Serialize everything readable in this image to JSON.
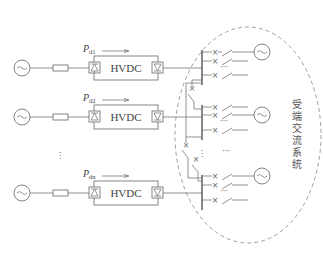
{
  "diagram": {
    "type": "multi-infeed HVDC power system schematic",
    "links": [
      {
        "id": "link-1",
        "power_label": "P",
        "power_subscript": "d1",
        "converter_label": "HVDC"
      },
      {
        "id": "link-2",
        "power_label": "P",
        "power_subscript": "d2",
        "converter_label": "HVDC"
      },
      {
        "id": "link-n",
        "power_label": "P",
        "power_subscript": "dn",
        "converter_label": "HVDC"
      }
    ],
    "sending_ellipsis": "⋮",
    "receiving_system": {
      "label": "受端交流系统",
      "label_chars": [
        "受",
        "端",
        "交",
        "流",
        "系",
        "统"
      ]
    },
    "feeder_ellipsis": "···",
    "icons": {
      "generator": "ac-generator-icon (circle with ~)",
      "impedance": "impedance-icon (rectangle)",
      "rectifier": "rectifier-icon (boxed diode)",
      "inverter": "inverter-icon (boxed diode)",
      "breaker": "circuit-breaker-icon (x)",
      "switch": "disconnect-switch-icon",
      "arrow": "power-flow-arrow-icon"
    },
    "colors": {
      "line": "#777777",
      "bus": "#555555",
      "text": "#444444",
      "dashed_boundary": "#888888",
      "background": "#ffffff"
    }
  }
}
